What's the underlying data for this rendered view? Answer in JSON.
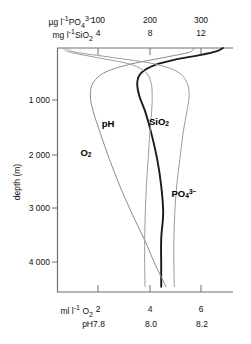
{
  "chart_data": {
    "type": "line",
    "title": "",
    "orientation": "vertical-profile",
    "ylabel": "depth (m)",
    "ylim": [
      0,
      4600
    ],
    "y_ticks": [
      1000,
      2000,
      3000,
      4000
    ],
    "y_tick_labels": [
      "1 000",
      "2 000",
      "3 000",
      "4 000"
    ],
    "grid": false,
    "legend": "inline-curve-labels",
    "top_axes": [
      {
        "unit_label": "µg l",
        "unit_exp": "-1",
        "species": "PO",
        "species_sub": "4",
        "species_sup": "3−",
        "ticks": [
          100,
          200,
          300
        ],
        "tick_labels": [
          "100",
          "200",
          "300"
        ],
        "range": [
          0,
          380
        ]
      },
      {
        "unit_label": "mg l",
        "unit_exp": "-1",
        "species": "SiO",
        "species_sub": "2",
        "species_sup": "",
        "ticks": [
          4,
          8,
          12
        ],
        "tick_labels": [
          "4",
          "8",
          "12"
        ],
        "range": [
          0,
          15.2
        ]
      }
    ],
    "bottom_axes": [
      {
        "unit_label": "ml l",
        "unit_exp": "-1",
        "species": "O",
        "species_sub": "2",
        "species_sup": "",
        "ticks": [
          2,
          4,
          6
        ],
        "tick_labels": [
          "2",
          "4",
          "6"
        ],
        "range": [
          0,
          7.6
        ]
      },
      {
        "unit_label": "",
        "unit_exp": "",
        "species": "pH",
        "species_sub": "",
        "species_sup": "",
        "ticks": [
          7.8,
          8.0,
          8.2
        ],
        "tick_labels": [
          "7.8",
          "8.0",
          "8.2"
        ],
        "range": [
          7.5,
          8.38
        ]
      }
    ],
    "series": [
      {
        "name": "pH",
        "label": "pH",
        "label_sub": "",
        "label_sup": "",
        "color": "#1a1a1a",
        "width": 1.9,
        "axis": "pH (bottom)",
        "label_pos": {
          "x": 108,
          "y": 124
        },
        "points": [
          {
            "depth": 0,
            "value": 8.33
          },
          {
            "depth": 60,
            "value": 8.3
          },
          {
            "depth": 130,
            "value": 8.22
          },
          {
            "depth": 210,
            "value": 8.1
          },
          {
            "depth": 320,
            "value": 7.99
          },
          {
            "depth": 470,
            "value": 7.92
          },
          {
            "depth": 650,
            "value": 7.9
          },
          {
            "depth": 900,
            "value": 7.91
          },
          {
            "depth": 1200,
            "value": 7.94
          },
          {
            "depth": 1600,
            "value": 7.97
          },
          {
            "depth": 2100,
            "value": 8.0
          },
          {
            "depth": 2600,
            "value": 8.02
          },
          {
            "depth": 3100,
            "value": 8.03
          },
          {
            "depth": 3600,
            "value": 8.02
          },
          {
            "depth": 4100,
            "value": 8.02
          },
          {
            "depth": 4500,
            "value": 8.02
          }
        ]
      },
      {
        "name": "O2",
        "label": "O",
        "label_sub": "2",
        "label_sup": "",
        "color": "#8a8a8a",
        "width": 1.0,
        "axis": "ml l-1 O2 (bottom)",
        "label_pos": {
          "x": 86,
          "y": 153
        },
        "points": [
          {
            "depth": 0,
            "value": 5.9
          },
          {
            "depth": 80,
            "value": 5.7
          },
          {
            "depth": 180,
            "value": 4.6
          },
          {
            "depth": 300,
            "value": 3.2
          },
          {
            "depth": 450,
            "value": 2.1
          },
          {
            "depth": 650,
            "value": 1.55
          },
          {
            "depth": 900,
            "value": 1.42
          },
          {
            "depth": 1200,
            "value": 1.55
          },
          {
            "depth": 1600,
            "value": 1.85
          },
          {
            "depth": 2100,
            "value": 2.25
          },
          {
            "depth": 2600,
            "value": 2.7
          },
          {
            "depth": 3100,
            "value": 3.2
          },
          {
            "depth": 3600,
            "value": 3.75
          },
          {
            "depth": 4100,
            "value": 4.25
          },
          {
            "depth": 4500,
            "value": 4.7
          }
        ]
      },
      {
        "name": "SiO2",
        "label": "SiO",
        "label_sub": "2",
        "label_sup": "",
        "color": "#9c9c9c",
        "width": 1.0,
        "axis": "mg l-1 SiO2 (top)",
        "label_pos": {
          "x": 159,
          "y": 122
        },
        "points": [
          {
            "depth": 0,
            "value": 0.45
          },
          {
            "depth": 80,
            "value": 1.1
          },
          {
            "depth": 180,
            "value": 3.4
          },
          {
            "depth": 300,
            "value": 6.2
          },
          {
            "depth": 450,
            "value": 7.6
          },
          {
            "depth": 650,
            "value": 8.1
          },
          {
            "depth": 900,
            "value": 8.2
          },
          {
            "depth": 1200,
            "value": 8.15
          },
          {
            "depth": 1600,
            "value": 8.0
          },
          {
            "depth": 2100,
            "value": 7.85
          },
          {
            "depth": 2600,
            "value": 7.7
          },
          {
            "depth": 3100,
            "value": 7.6
          },
          {
            "depth": 3600,
            "value": 7.55
          },
          {
            "depth": 4100,
            "value": 7.55
          },
          {
            "depth": 4500,
            "value": 7.58
          }
        ]
      },
      {
        "name": "PO4",
        "label": "PO",
        "label_sub": "4",
        "label_sup": "3−",
        "color": "#9c9c9c",
        "width": 1.0,
        "axis": "µg l-1 PO4 3- (top)",
        "label_pos": {
          "x": 184,
          "y": 194
        },
        "points": [
          {
            "depth": 0,
            "value": 18
          },
          {
            "depth": 80,
            "value": 40
          },
          {
            "depth": 180,
            "value": 120
          },
          {
            "depth": 300,
            "value": 210
          },
          {
            "depth": 450,
            "value": 260
          },
          {
            "depth": 650,
            "value": 280
          },
          {
            "depth": 900,
            "value": 285
          },
          {
            "depth": 1200,
            "value": 280
          },
          {
            "depth": 1600,
            "value": 272
          },
          {
            "depth": 2100,
            "value": 265
          },
          {
            "depth": 2600,
            "value": 258
          },
          {
            "depth": 3100,
            "value": 254
          },
          {
            "depth": 3600,
            "value": 252
          },
          {
            "depth": 4100,
            "value": 252
          },
          {
            "depth": 4500,
            "value": 253
          }
        ]
      }
    ]
  },
  "axes": {
    "top_row1": {
      "unit": "µg l",
      "exp": "-1",
      "sp": "PO",
      "sub": "4",
      "sup": "3−"
    },
    "top_row2": {
      "unit": "mg l",
      "exp": "-1",
      "sp": "SiO",
      "sub": "2",
      "sup": ""
    },
    "bottom_row1": {
      "unit": "ml l",
      "exp": "-1",
      "sp": "O",
      "sub": "2",
      "sup": ""
    },
    "bottom_row2": {
      "label": "pH"
    },
    "ylabel": "depth (m)"
  },
  "ticks": {
    "top1": [
      "100",
      "200",
      "300"
    ],
    "top2": [
      "4",
      "8",
      "12"
    ],
    "bottom1": [
      "2",
      "4",
      "6"
    ],
    "bottom2": [
      "7.8",
      "8.0",
      "8.2"
    ],
    "depth": [
      "1 000",
      "2 000",
      "3 000",
      "4 000"
    ]
  }
}
